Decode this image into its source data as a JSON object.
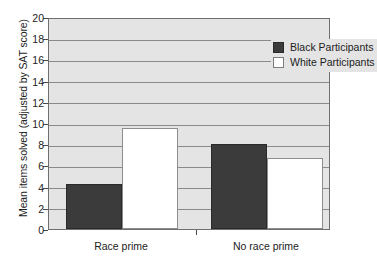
{
  "chart_data": {
    "type": "bar",
    "title": "",
    "xlabel": "",
    "ylabel": "Mean items solved (adjusted by SAT score)",
    "categories": [
      "Race prime",
      "No race prime"
    ],
    "series": [
      {
        "name": "Black Participants",
        "color": "#3b3b3b",
        "values": [
          4.2,
          8.0
        ]
      },
      {
        "name": "White Participants",
        "color": "#ffffff",
        "values": [
          9.5,
          6.7
        ]
      }
    ],
    "ylim": [
      0,
      20
    ],
    "ytick_step": 2,
    "ytick_labels": [
      "0",
      "2",
      "4",
      "6",
      "8",
      "10",
      "12",
      "14",
      "16",
      "18",
      "20"
    ],
    "grid": true,
    "legend_position": "top-right",
    "plot_background": "#e4e4e4",
    "gridline_color": "#8a8a8a"
  }
}
